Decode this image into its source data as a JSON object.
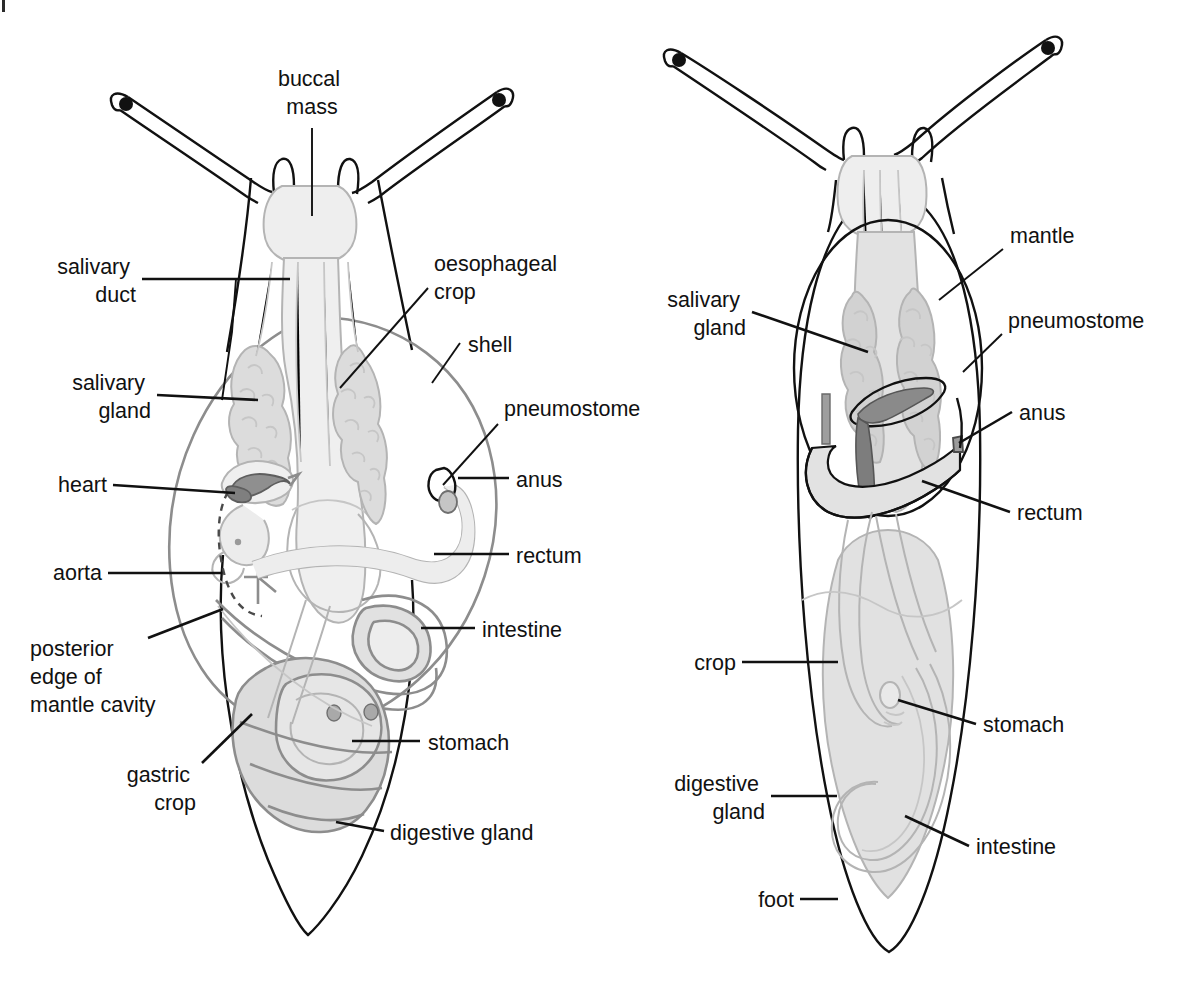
{
  "figure": {
    "type": "anatomical-diagram",
    "panels": [
      {
        "id": "left",
        "name": "snail",
        "description": "snail with shell, dorsal view"
      },
      {
        "id": "right",
        "name": "slug",
        "description": "slug with mantle, dorsal view"
      }
    ]
  },
  "colors": {
    "ink": "#111111",
    "organ_outline_mid": "#8d8d8d",
    "organ_outline_light": "#b4b4b4",
    "organ_fill_light": "#e4e4e4",
    "organ_fill_mid": "#d5d5d5",
    "heart_fill": "#8a8a8a",
    "background": "#ffffff"
  },
  "snail": {
    "labels": {
      "buccal_mass": "buccal\nmass",
      "buccal_mass_l1": "buccal",
      "buccal_mass_l2": "mass",
      "salivary_duct_l1": "salivary",
      "salivary_duct_l2": "duct",
      "salivary_gland_l1": "salivary",
      "salivary_gland_l2": "gland",
      "heart": "heart",
      "aorta": "aorta",
      "posterior_edge_l1": "posterior",
      "posterior_edge_l2": "edge of",
      "posterior_edge_l3": "mantle cavity",
      "gastric_crop_l1": "gastric",
      "gastric_crop_l2": "crop",
      "oesophageal_crop_l1": "oesophageal",
      "oesophageal_crop_l2": "crop",
      "shell": "shell",
      "pneumostome": "pneumostome",
      "anus": "anus",
      "rectum": "rectum",
      "intestine": "intestine",
      "stomach": "stomach",
      "digestive_gland": "digestive gland"
    }
  },
  "slug": {
    "labels": {
      "salivary_gland_l1": "salivary",
      "salivary_gland_l2": "gland",
      "crop": "crop",
      "digestive_gland_l1": "digestive",
      "digestive_gland_l2": "gland",
      "foot": "foot",
      "mantle": "mantle",
      "pneumostome": "pneumostome",
      "anus": "anus",
      "rectum": "rectum",
      "stomach": "stomach",
      "intestine": "intestine"
    }
  }
}
